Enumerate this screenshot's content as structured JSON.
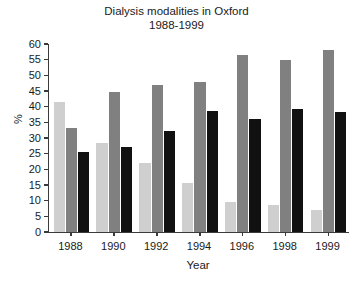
{
  "chart_data": {
    "type": "bar",
    "title": "Dialysis modalities in Oxford",
    "subtitle": "1988-1999",
    "xlabel": "Year",
    "ylabel": "%",
    "categories": [
      "1988",
      "1990",
      "1992",
      "1994",
      "1996",
      "1998",
      "1999"
    ],
    "ylim": [
      0,
      60
    ],
    "ytick_step": 5,
    "yticks": [
      "0",
      "5",
      "10",
      "15",
      "20",
      "25",
      "30",
      "35",
      "40",
      "45",
      "50",
      "55",
      "60"
    ],
    "grid": false,
    "legend": "none",
    "series": [
      {
        "name": "series-1-light-gray",
        "color": "#cfcfcf",
        "values": [
          41.5,
          28.5,
          22.0,
          15.8,
          9.7,
          8.6,
          7.0
        ]
      },
      {
        "name": "series-2-medium-gray",
        "color": "#808080",
        "values": [
          33.2,
          44.7,
          47.0,
          48.0,
          56.5,
          55.0,
          58.0
        ]
      },
      {
        "name": "series-3-black",
        "color": "#111111",
        "values": [
          25.5,
          27.0,
          32.2,
          38.5,
          36.0,
          39.2,
          38.2
        ]
      }
    ]
  }
}
